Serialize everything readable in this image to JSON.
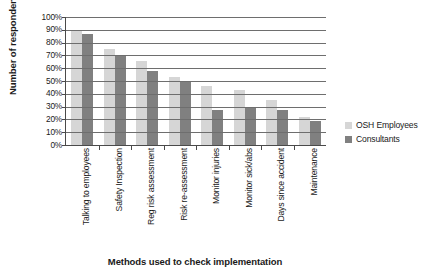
{
  "chart_data": {
    "type": "bar",
    "title": "",
    "xlabel": "Methods used to check implementation",
    "ylabel": "Number of respondents",
    "ylim": [
      0,
      100
    ],
    "yunit": "%",
    "grid": true,
    "legend_position": "right",
    "categories": [
      "Talking to employees",
      "Safety Inspection",
      "Reg risk assessment",
      "Risk re-assessment",
      "Monitor injuries",
      "Monitor sick/abs",
      "Days since accident",
      "Maintenance"
    ],
    "ytick_labels": [
      "100%",
      "90%",
      "80%",
      "70%",
      "60%",
      "50%",
      "40%",
      "30%",
      "20%",
      "10%",
      "0%"
    ],
    "ytick_values": [
      100,
      90,
      80,
      70,
      60,
      50,
      40,
      30,
      20,
      10,
      0
    ],
    "series": [
      {
        "name": "OSH Employees",
        "color": "#d6d6d6",
        "values": [
          90,
          75,
          66,
          53,
          46,
          43,
          35,
          22
        ]
      },
      {
        "name": "Consultants",
        "color": "#808080",
        "values": [
          87,
          70,
          58,
          49,
          27,
          30,
          27,
          19
        ]
      }
    ]
  },
  "legend": {
    "items": [
      {
        "label": "OSH Employees",
        "color": "#d6d6d6"
      },
      {
        "label": "Consultants",
        "color": "#808080"
      }
    ]
  }
}
